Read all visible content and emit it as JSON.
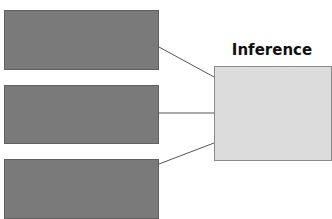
{
  "diagram": {
    "title": "Inference",
    "colors": {
      "input_box": "#7a7a7a",
      "inference_box": "#dcdcdc",
      "connector": "#555555"
    },
    "nodes": [
      {
        "id": "input-1",
        "label": ""
      },
      {
        "id": "input-2",
        "label": ""
      },
      {
        "id": "input-3",
        "label": ""
      },
      {
        "id": "inference",
        "label": "Inference"
      }
    ],
    "edges": [
      {
        "from": "input-1",
        "to": "inference"
      },
      {
        "from": "input-2",
        "to": "inference"
      },
      {
        "from": "input-3",
        "to": "inference"
      }
    ]
  }
}
